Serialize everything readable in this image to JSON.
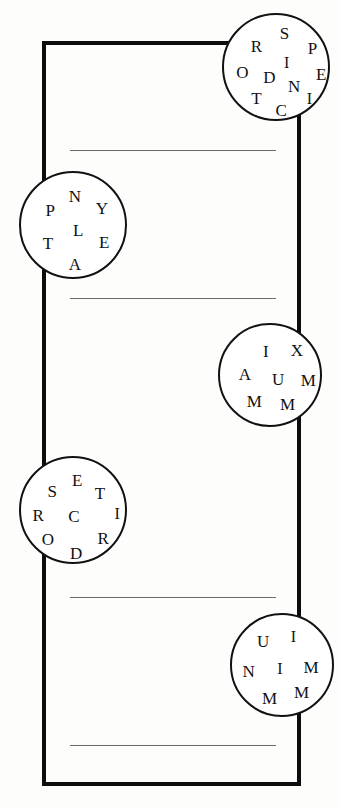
{
  "page": {
    "background_color": "#fdfdfc",
    "width": 339,
    "height": 807
  },
  "frame": {
    "name": "outer-border",
    "color": "#0d0d0d",
    "stroke_width": 4,
    "x": 42,
    "y": 41,
    "width": 259,
    "height": 745
  },
  "answer_lines": [
    {
      "label": "answer-line-1",
      "x": 70,
      "y": 150,
      "width": 206,
      "color": "#6b6b6b"
    },
    {
      "label": "answer-line-2",
      "x": 70,
      "y": 298,
      "width": 206,
      "color": "#6b6b6b"
    },
    {
      "label": "answer-line-3",
      "x": 70,
      "y": 597,
      "width": 206,
      "color": "#6b6b6b"
    },
    {
      "label": "answer-line-4",
      "x": 70,
      "y": 745,
      "width": 206,
      "color": "#6b6b6b"
    }
  ],
  "circles": [
    {
      "id": "circle-1",
      "cx": 276,
      "cy": 67,
      "r": 54,
      "letters": [
        {
          "char": "R",
          "x": 30,
          "y": 29,
          "size": 17
        },
        {
          "char": "S",
          "x": 56,
          "y": 17,
          "size": 17
        },
        {
          "char": "P",
          "x": 82,
          "y": 31,
          "size": 17
        },
        {
          "char": "I",
          "x": 58,
          "y": 44,
          "size": 16
        },
        {
          "char": "O",
          "x": 17,
          "y": 53,
          "size": 17
        },
        {
          "char": "D",
          "x": 42,
          "y": 57,
          "size": 17
        },
        {
          "char": "N",
          "x": 65,
          "y": 66,
          "size": 17
        },
        {
          "char": "E",
          "x": 90,
          "y": 55,
          "size": 17
        },
        {
          "char": "T",
          "x": 30,
          "y": 77,
          "size": 17
        },
        {
          "char": "I",
          "x": 79,
          "y": 78,
          "size": 16
        },
        {
          "char": "C",
          "x": 53,
          "y": 88,
          "size": 17
        }
      ]
    },
    {
      "id": "circle-2",
      "cx": 73,
      "cy": 225,
      "r": 54,
      "letters": [
        {
          "char": "N",
          "x": 50,
          "y": 21,
          "size": 17
        },
        {
          "char": "P",
          "x": 27,
          "y": 34,
          "size": 17
        },
        {
          "char": "Y",
          "x": 75,
          "y": 32,
          "size": 17
        },
        {
          "char": "L",
          "x": 53,
          "y": 53,
          "size": 17
        },
        {
          "char": "T",
          "x": 25,
          "y": 65,
          "size": 17
        },
        {
          "char": "E",
          "x": 77,
          "y": 64,
          "size": 17
        },
        {
          "char": "A",
          "x": 50,
          "y": 84,
          "size": 17
        }
      ]
    },
    {
      "id": "circle-3",
      "cx": 270,
      "cy": 375,
      "r": 52,
      "letters": [
        {
          "char": "I",
          "x": 44,
          "y": 25,
          "size": 17
        },
        {
          "char": "X",
          "x": 74,
          "y": 24,
          "size": 17
        },
        {
          "char": "A",
          "x": 24,
          "y": 47,
          "size": 17
        },
        {
          "char": "U",
          "x": 56,
          "y": 52,
          "size": 17
        },
        {
          "char": "M",
          "x": 85,
          "y": 53,
          "size": 17
        },
        {
          "char": "M",
          "x": 33,
          "y": 73,
          "size": 17
        },
        {
          "char": "M",
          "x": 65,
          "y": 76,
          "size": 17
        }
      ]
    },
    {
      "id": "circle-4",
      "cx": 73,
      "cy": 510,
      "r": 54,
      "letters": [
        {
          "char": "E",
          "x": 52,
          "y": 20,
          "size": 17
        },
        {
          "char": "S",
          "x": 29,
          "y": 31,
          "size": 17
        },
        {
          "char": "T",
          "x": 73,
          "y": 32,
          "size": 17
        },
        {
          "char": "R",
          "x": 16,
          "y": 53,
          "size": 17
        },
        {
          "char": "C",
          "x": 49,
          "y": 54,
          "size": 17
        },
        {
          "char": "I",
          "x": 89,
          "y": 52,
          "size": 16
        },
        {
          "char": "O",
          "x": 25,
          "y": 75,
          "size": 17
        },
        {
          "char": "R",
          "x": 76,
          "y": 74,
          "size": 17
        },
        {
          "char": "D",
          "x": 51,
          "y": 88,
          "size": 17
        }
      ]
    },
    {
      "id": "circle-5",
      "cx": 282,
      "cy": 665,
      "r": 52,
      "letters": [
        {
          "char": "U",
          "x": 30,
          "y": 25,
          "size": 17
        },
        {
          "char": "I",
          "x": 59,
          "y": 21,
          "size": 16
        },
        {
          "char": "N",
          "x": 16,
          "y": 54,
          "size": 17
        },
        {
          "char": "I",
          "x": 46,
          "y": 52,
          "size": 16
        },
        {
          "char": "M",
          "x": 76,
          "y": 50,
          "size": 17
        },
        {
          "char": "M",
          "x": 36,
          "y": 80,
          "size": 17
        },
        {
          "char": "M",
          "x": 67,
          "y": 74,
          "size": 17
        }
      ]
    }
  ]
}
